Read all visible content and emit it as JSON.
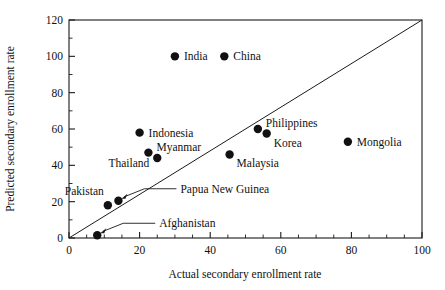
{
  "chart_data": {
    "type": "scatter",
    "title": "",
    "xlabel": "Actual secondary enrollment rate",
    "ylabel": "Predicted secondary enrollment rate",
    "xlim": [
      0,
      100
    ],
    "ylim": [
      0,
      120
    ],
    "grid": false,
    "legend": "none",
    "x_ticks": [
      0,
      20,
      40,
      60,
      80,
      100
    ],
    "y_ticks": [
      0,
      20,
      40,
      60,
      80,
      100,
      120
    ],
    "x_tick_labels": [
      "0",
      "20",
      "40",
      "60",
      "80",
      "100"
    ],
    "y_tick_labels": [
      "0",
      "20",
      "40",
      "60",
      "80",
      "100",
      "120"
    ],
    "x_minor_step": 5,
    "y_minor_step": 10,
    "reference_line": {
      "name": "45-degree identity line",
      "from": [
        0,
        0
      ],
      "to": [
        100,
        120
      ],
      "note": "line from origin to top-right corner of plot frame"
    },
    "points": [
      {
        "label": "India",
        "x": 30.0,
        "y": 100.0,
        "label_pos": "right",
        "leader": false
      },
      {
        "label": "China",
        "x": 44.0,
        "y": 100.0,
        "label_pos": "right",
        "leader": false
      },
      {
        "label": "Indonesia",
        "x": 20.0,
        "y": 58.0,
        "label_pos": "right",
        "leader": false
      },
      {
        "label": "Myanmar",
        "x": 22.5,
        "y": 47.0,
        "label_pos": "right-up",
        "leader": false
      },
      {
        "label": "Thailand",
        "x": 25.0,
        "y": 44.0,
        "label_pos": "left",
        "leader": false
      },
      {
        "label": "Philippines",
        "x": 53.5,
        "y": 60.0,
        "label_pos": "right-up",
        "leader": false
      },
      {
        "label": "Korea",
        "x": 56.0,
        "y": 57.5,
        "label_pos": "right-down",
        "leader": false
      },
      {
        "label": "Mongolia",
        "x": 79.0,
        "y": 53.0,
        "label_pos": "right",
        "leader": false
      },
      {
        "label": "Malaysia",
        "x": 45.5,
        "y": 46.0,
        "label_pos": "right-down",
        "leader": false
      },
      {
        "label": "Pakistan",
        "x": 11.0,
        "y": 18.0,
        "label_pos": "above-left",
        "leader": false
      },
      {
        "label": "Papua New Guinea",
        "x": 14.0,
        "y": 20.5,
        "label_pos": "leader-right",
        "leader": true
      },
      {
        "label": "Afghanistan",
        "x": 8.0,
        "y": 1.5,
        "label_pos": "leader-right",
        "leader": true
      }
    ]
  },
  "colors": {
    "marker": "#111111",
    "axis": "#1a1a1a",
    "background": "#ffffff",
    "text": "#111111"
  }
}
